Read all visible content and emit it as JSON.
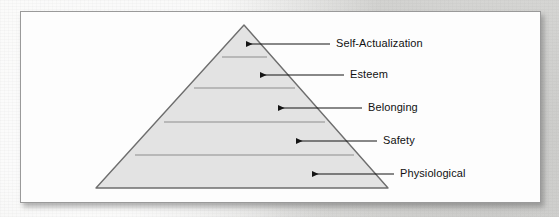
{
  "figure": {
    "type": "pyramid-hierarchy",
    "tier_count": 5,
    "fill_color": "#e3e3e3",
    "stroke_color": "#6e6e6e",
    "divider_color": "#8d8d8d",
    "leader_color": "#151515",
    "card_background": "#fdfdfd",
    "card_border_color": "#9a9a9a",
    "page_background": "#e8e8e6"
  },
  "tiers": [
    {
      "id": "self-actualization",
      "label": "Self-Actualization",
      "rank": 5,
      "position": "top",
      "arrow_tip_x": 246,
      "leader_end_x": 330,
      "label_x": 336,
      "center_y": 44
    },
    {
      "id": "esteem",
      "label": "Esteem",
      "rank": 4,
      "position": "second",
      "arrow_tip_x": 260,
      "leader_end_x": 344,
      "label_x": 350,
      "center_y": 75
    },
    {
      "id": "belonging",
      "label": "Belonging",
      "rank": 3,
      "position": "middle",
      "arrow_tip_x": 278,
      "leader_end_x": 362,
      "label_x": 368,
      "center_y": 108
    },
    {
      "id": "safety",
      "label": "Safety",
      "rank": 2,
      "position": "fourth",
      "arrow_tip_x": 296,
      "leader_end_x": 377,
      "label_x": 383,
      "center_y": 141
    },
    {
      "id": "physiological",
      "label": "Physiological",
      "rank": 1,
      "position": "base",
      "arrow_tip_x": 312,
      "leader_end_x": 394,
      "label_x": 400,
      "center_y": 174
    }
  ],
  "geometry": {
    "apex_x": 244,
    "apex_y": 25,
    "base_left_x": 96,
    "base_right_x": 388,
    "base_y": 188,
    "divider_y": [
      57,
      88,
      122,
      155
    ]
  }
}
